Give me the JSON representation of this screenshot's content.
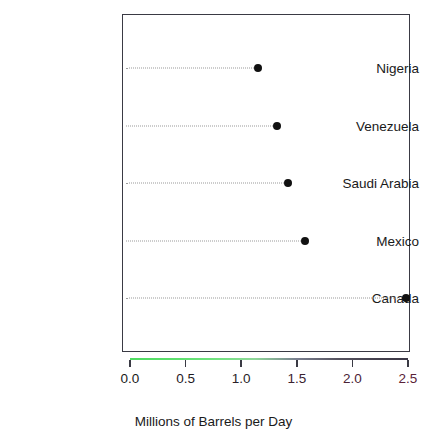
{
  "artifact": {
    "clipped_header_text": "— — — —  — — —  —"
  },
  "chart_data": {
    "type": "scatter",
    "subtype": "dot-plot",
    "title": "",
    "xlabel": "Millions of Barrels per Day",
    "ylabel": "",
    "categories": [
      "Nigeria",
      "Venezuela",
      "Saudi Arabia",
      "Mexico",
      "Canada"
    ],
    "values": [
      1.15,
      1.32,
      1.42,
      1.57,
      2.48
    ],
    "xlim": [
      0.0,
      2.5
    ],
    "xticks": [
      0.0,
      0.5,
      1.0,
      1.5,
      2.0,
      2.5
    ],
    "xtick_labels": [
      "0.0",
      "0.5",
      "1.0",
      "1.5",
      "2.0",
      "2.5"
    ],
    "grid": "dotted-horizontal-guides",
    "legend": "none",
    "point_color": "#111111",
    "guide_color": "#9a9a9a",
    "frame_color": "#3a3a44",
    "axis_gradient_start": "#4fdc62",
    "axis_gradient_end": "#3b3746",
    "tick_label_colors": [
      "#1a1a1a",
      "#1f1a1f",
      "#2a1f28",
      "#3a2230",
      "#4a2236",
      "#5a2238"
    ]
  }
}
